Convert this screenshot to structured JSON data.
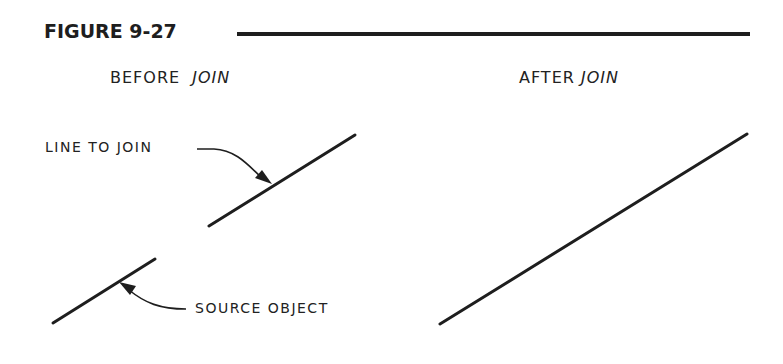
{
  "figure": {
    "title": "FIGURE 9-27",
    "rule_color": "#1e1e1e"
  },
  "panels": {
    "before": {
      "caption_prefix": "BEFORE",
      "caption_command": "JOIN",
      "labels": {
        "line_to_join": "LINE TO JOIN",
        "source_object": "SOURCE OBJECT"
      },
      "lines": [
        {
          "name": "line-to-join",
          "x1": 209,
          "y1": 226,
          "x2": 355,
          "y2": 135
        },
        {
          "name": "source-object",
          "x1": 53,
          "y1": 323,
          "x2": 155,
          "y2": 259
        }
      ]
    },
    "after": {
      "caption_prefix": "AFTER",
      "caption_command": "JOIN",
      "lines": [
        {
          "name": "joined-line",
          "x1": 440,
          "y1": 324,
          "x2": 747,
          "y2": 134
        }
      ]
    }
  },
  "colors": {
    "ink": "#1e1e1e",
    "background": "#ffffff"
  }
}
